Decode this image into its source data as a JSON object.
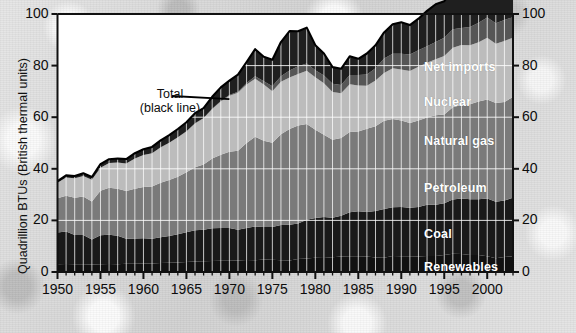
{
  "chart_data": {
    "type": "area",
    "title": "",
    "xlabel": "",
    "ylabel": "Quadrillion BTUs (British thermal units)",
    "ylabel_right": "",
    "xlim": [
      1950,
      2003
    ],
    "ylim": [
      0,
      100
    ],
    "yticks": [
      0,
      20,
      40,
      60,
      80,
      100
    ],
    "yticks_right": [
      0,
      20,
      40,
      60,
      80,
      100
    ],
    "xticks": [
      1950,
      1955,
      1960,
      1965,
      1970,
      1975,
      1980,
      1985,
      1990,
      1995,
      2000
    ],
    "xminor_step": 1,
    "grid": "vertical-white-plus-horizontal-white",
    "legend_position": "inline-labels",
    "stacked": true,
    "annotations": [
      {
        "text_line1": "Total",
        "text_line2": "(black line)",
        "x": 1960.5,
        "y": 68,
        "leader_to_x": 1970,
        "leader_to_y": 67
      }
    ],
    "x": [
      1950,
      1951,
      1952,
      1953,
      1954,
      1955,
      1956,
      1957,
      1958,
      1959,
      1960,
      1961,
      1962,
      1963,
      1964,
      1965,
      1966,
      1967,
      1968,
      1969,
      1970,
      1971,
      1972,
      1973,
      1974,
      1975,
      1976,
      1977,
      1978,
      1979,
      1980,
      1981,
      1982,
      1983,
      1984,
      1985,
      1986,
      1987,
      1988,
      1989,
      1990,
      1991,
      1992,
      1993,
      1994,
      1995,
      1996,
      1997,
      1998,
      1999,
      2000,
      2001,
      2002,
      2003
    ],
    "series": [
      {
        "name": "Renewables",
        "color": "#111111",
        "values": [
          2.98,
          3.1,
          3.05,
          3.0,
          2.95,
          3.05,
          3.1,
          3.05,
          3.15,
          3.2,
          3.25,
          3.3,
          3.5,
          3.55,
          3.7,
          3.9,
          4.05,
          4.2,
          4.25,
          4.35,
          4.4,
          4.5,
          4.65,
          4.55,
          4.8,
          4.75,
          4.6,
          4.45,
          5.05,
          5.2,
          5.5,
          5.4,
          5.75,
          6.0,
          6.15,
          6.1,
          6.05,
          5.6,
          5.55,
          6.2,
          6.1,
          6.15,
          6.05,
          6.25,
          6.2,
          6.6,
          7.1,
          7.0,
          6.55,
          6.55,
          6.1,
          5.3,
          5.8,
          6.1
        ]
      },
      {
        "name": "Coal",
        "color": "#191919",
        "values": [
          12.35,
          12.55,
          11.3,
          11.35,
          9.65,
          11.15,
          11.35,
          11.0,
          9.75,
          9.75,
          9.8,
          9.6,
          10.0,
          10.45,
          10.9,
          11.55,
          12.15,
          12.2,
          12.7,
          12.75,
          12.65,
          11.9,
          12.4,
          13.05,
          12.65,
          12.65,
          13.6,
          13.9,
          13.75,
          15.05,
          15.4,
          15.9,
          15.3,
          15.85,
          17.05,
          17.4,
          17.25,
          18.0,
          18.85,
          18.9,
          19.1,
          18.75,
          19.1,
          19.8,
          19.9,
          20.05,
          21.0,
          21.45,
          21.65,
          21.6,
          22.4,
          21.9,
          21.9,
          22.7
        ]
      },
      {
        "name": "Petroleum",
        "color": "#7a7a7a",
        "values": [
          13.3,
          13.95,
          14.43,
          14.9,
          14.77,
          17.25,
          18.22,
          18.25,
          18.53,
          19.32,
          19.92,
          20.22,
          21.05,
          21.7,
          22.3,
          23.25,
          24.4,
          25.28,
          27.0,
          28.34,
          29.52,
          30.56,
          32.95,
          34.84,
          33.46,
          32.73,
          35.17,
          37.12,
          37.97,
          37.12,
          34.2,
          31.93,
          30.23,
          30.05,
          31.05,
          30.92,
          32.2,
          32.87,
          34.22,
          34.21,
          33.55,
          32.85,
          33.53,
          33.84,
          34.67,
          34.44,
          35.76,
          36.27,
          36.82,
          37.96,
          38.4,
          38.33,
          38.23,
          39.07
        ]
      },
      {
        "name": "Natural gas",
        "color": "#bcbcbc",
        "values": [
          6.0,
          7.05,
          7.55,
          8.0,
          8.35,
          9.0,
          9.6,
          10.19,
          10.66,
          11.72,
          12.39,
          12.93,
          13.73,
          14.4,
          15.29,
          15.77,
          17.0,
          17.94,
          19.21,
          20.68,
          21.79,
          22.47,
          22.7,
          22.51,
          21.73,
          19.95,
          20.35,
          19.93,
          20.0,
          20.67,
          20.39,
          19.93,
          18.51,
          17.36,
          18.51,
          17.83,
          16.71,
          17.74,
          18.55,
          19.71,
          19.73,
          20.13,
          20.83,
          21.23,
          21.73,
          22.67,
          23.09,
          23.22,
          22.83,
          22.91,
          23.92,
          22.9,
          23.63,
          22.95
        ]
      },
      {
        "name": "Nuclear",
        "color": "#565656",
        "values": [
          0,
          0,
          0,
          0,
          0,
          0,
          0,
          0,
          0,
          0.01,
          0.01,
          0.02,
          0.03,
          0.04,
          0.04,
          0.04,
          0.06,
          0.09,
          0.14,
          0.15,
          0.24,
          0.41,
          0.58,
          0.91,
          1.27,
          1.9,
          2.11,
          2.7,
          3.02,
          2.78,
          2.74,
          3.01,
          3.13,
          3.2,
          3.55,
          4.08,
          4.38,
          4.75,
          5.59,
          5.6,
          6.1,
          6.42,
          6.48,
          6.41,
          6.69,
          7.08,
          7.17,
          6.6,
          7.07,
          7.61,
          7.86,
          8.03,
          8.14,
          7.96
        ]
      },
      {
        "name": "Net imports",
        "color": "#1f1f1f",
        "values": [
          0.55,
          0.8,
          0.9,
          1.0,
          1.1,
          1.35,
          1.45,
          1.5,
          1.7,
          2.05,
          2.2,
          2.4,
          2.7,
          2.9,
          3.2,
          3.55,
          3.9,
          3.8,
          4.6,
          5.3,
          5.55,
          6.7,
          8.1,
          10.5,
          9.5,
          10.3,
          13.3,
          15.3,
          13.5,
          13.9,
          9.7,
          8.5,
          6.5,
          6.3,
          7.3,
          6.3,
          8.1,
          8.9,
          10.1,
          11.4,
          12.2,
          11.4,
          12.2,
          13.7,
          14.6,
          14.1,
          15.4,
          17.0,
          18.4,
          19.0,
          20.3,
          21.3,
          20.5,
          22.0
        ]
      }
    ]
  },
  "axes": {
    "left_labels": [
      "100",
      "80",
      "60",
      "40",
      "20",
      "0"
    ],
    "right_labels": [
      "100",
      "80",
      "60",
      "40",
      "20",
      "0"
    ],
    "x_labels": [
      "1950",
      "1955",
      "1960",
      "1965",
      "1970",
      "1975",
      "1980",
      "1985",
      "1990",
      "1995",
      "2000"
    ],
    "y_axis_title": "Quadrillion BTUs (British thermal units)"
  },
  "labels": {
    "net_imports": "Net imports",
    "nuclear": "Nuclear",
    "natural_gas": "Natural gas",
    "petroleum": "Petroleum",
    "coal": "Coal",
    "renewables": "Renewables",
    "total_line1": "Total",
    "total_line2": "(black line)"
  },
  "colors": {
    "renewables": "#111111",
    "coal": "#191919",
    "petroleum": "#7a7a7a",
    "natural_gas": "#bcbcbc",
    "nuclear": "#565656",
    "net_imports": "#1f1f1f",
    "total_line": "#000000",
    "plot_background": "#ffffff",
    "gridline": "#ffffff",
    "axis": "#111111"
  }
}
